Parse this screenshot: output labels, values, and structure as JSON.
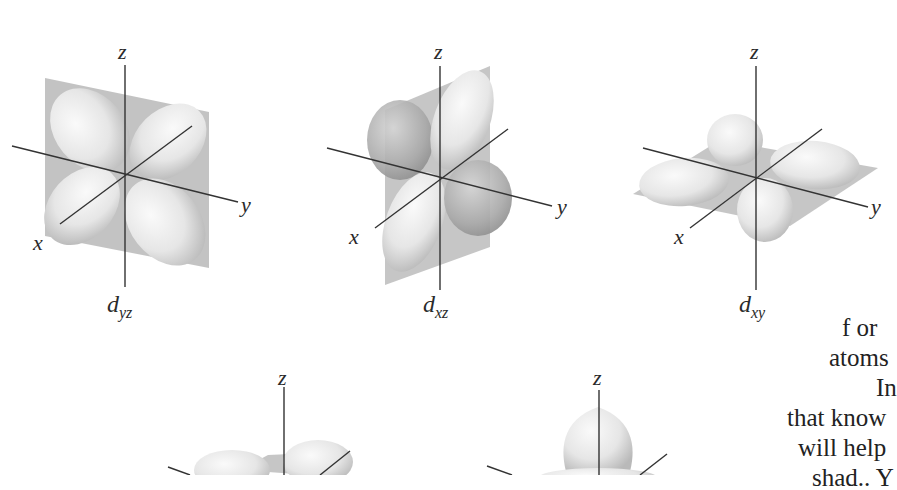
{
  "figure": {
    "orbitals": [
      {
        "id": "dyz",
        "base": "d",
        "subscript": "yz",
        "axes": {
          "x": "x",
          "y": "y",
          "z": "z"
        }
      },
      {
        "id": "dxz",
        "base": "d",
        "subscript": "xz",
        "axes": {
          "x": "x",
          "y": "y",
          "z": "z"
        }
      },
      {
        "id": "dxy",
        "base": "d",
        "subscript": "xy",
        "axes": {
          "x": "x",
          "y": "y",
          "z": "z"
        }
      },
      {
        "id": "dx2y2",
        "axes": {
          "z": "z"
        }
      },
      {
        "id": "dz2",
        "axes": {
          "z": "z"
        }
      }
    ]
  },
  "body_text": {
    "lines": [
      "f or",
      "atoms",
      "In",
      "that know",
      "will help",
      "shad.. Y"
    ]
  },
  "colors": {
    "plane": "#b4b4b4",
    "lobe_light": "#efefef",
    "lobe_shade": "#bdbdbd",
    "axis": "#333333"
  }
}
